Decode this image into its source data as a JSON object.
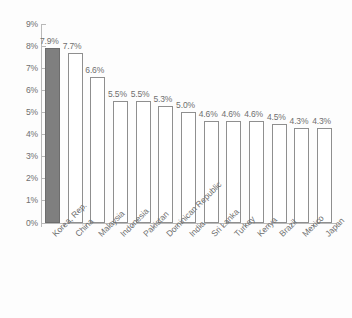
{
  "chart_data": {
    "type": "bar",
    "title": "",
    "subtitle": "",
    "xlabel": "",
    "ylabel": "",
    "ylim": [
      0,
      9
    ],
    "y_tick_labels": [
      "9%",
      "8%",
      "7%",
      "6%",
      "5%",
      "4%",
      "3%",
      "2%",
      "1%",
      "0%"
    ],
    "y_tick_values": [
      9,
      8,
      7,
      6,
      5,
      4,
      3,
      2,
      1,
      0
    ],
    "grid": false,
    "legend": null,
    "value_suffix": "%",
    "categories": [
      "Korea, Rep.",
      "China",
      "Malaysia",
      "Indonesia",
      "Pakistan",
      "Dominican Republic",
      "India",
      "Sri Lanka",
      "Turkey",
      "Kenya",
      "Brazil",
      "Mexico",
      "Japan"
    ],
    "values": [
      7.9,
      7.7,
      6.6,
      5.5,
      5.5,
      5.3,
      5.0,
      4.6,
      4.6,
      4.6,
      4.5,
      4.3,
      4.3
    ],
    "data_labels": [
      "7.9%",
      "7.7%",
      "6.6%",
      "5.5%",
      "5.5%",
      "5.3%",
      "5.0%",
      "4.6%",
      "4.6%",
      "4.6%",
      "4.5%",
      "4.3%",
      "4.3%"
    ],
    "highlight_index": 0,
    "colors": {
      "highlight_fill": "#7f7f7f",
      "bar_fill": "#ffffff",
      "bar_outline": "#8f8f8f",
      "axis": "#b9b9b9",
      "text": "#6f6f6f",
      "background": "#fdfdfd"
    }
  }
}
